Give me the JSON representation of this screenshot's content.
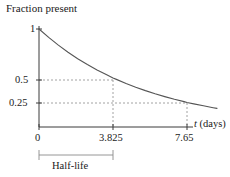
{
  "chart_data": {
    "type": "line",
    "title": "Fraction present",
    "xlabel": "t (days)",
    "ylabel": "",
    "xlim": [
      0,
      9.2
    ],
    "ylim": [
      0,
      1.08
    ],
    "grid": false,
    "legend": null,
    "x_ticks": [
      {
        "value": 0,
        "label": "0"
      },
      {
        "value": 3.825,
        "label": "3.825"
      },
      {
        "value": 7.65,
        "label": "7.65"
      }
    ],
    "y_ticks": [
      {
        "value": 0.25,
        "label": "0.25"
      },
      {
        "value": 0.5,
        "label": "0.5"
      },
      {
        "value": 1,
        "label": "1"
      }
    ],
    "series": [
      {
        "name": "exponential decay",
        "color": "#555555",
        "x": [
          0,
          0.5,
          1,
          1.5,
          2,
          2.5,
          3,
          3.5,
          3.825,
          4,
          4.5,
          5,
          5.5,
          6,
          6.5,
          7,
          7.5,
          7.65,
          8,
          8.5,
          9,
          9.2
        ],
        "y": [
          1,
          0.914,
          0.835,
          0.763,
          0.697,
          0.637,
          0.582,
          0.532,
          0.5,
          0.486,
          0.444,
          0.406,
          0.371,
          0.339,
          0.31,
          0.283,
          0.259,
          0.25,
          0.236,
          0.216,
          0.197,
          0.19
        ]
      }
    ],
    "annotations": [
      {
        "name": "half-life-bracket",
        "label": "Half-life",
        "from_x": 0,
        "to_x": 3.825
      },
      {
        "name": "guide-line-half",
        "y": 0.5,
        "x": 3.825
      },
      {
        "name": "guide-line-quarter",
        "y": 0.25,
        "x": 7.65
      }
    ]
  },
  "labels": {
    "title": "Fraction present",
    "y_1": "1",
    "y_05": "0.5",
    "y_025": "0.25",
    "x_0": "0",
    "x_halflife": "3.825",
    "x_doublehalflife": "7.65",
    "x_axis_variable": "t",
    "x_axis_units": "(days)",
    "halflife": "Half-life"
  },
  "colors": {
    "axis": "#3a3a3a",
    "curve": "#555555",
    "dashed": "#8a8a8a",
    "bracket": "#8a8a8a",
    "background": "#ffffff",
    "text": "#1a1a1a"
  }
}
